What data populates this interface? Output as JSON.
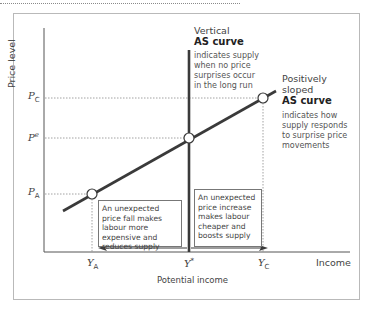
{
  "diagram": {
    "axes": {
      "y_label": "Price level",
      "x_label": "Income",
      "x_sub_label": "Potential income"
    },
    "y_ticks": [
      {
        "id": "pc",
        "base": "P",
        "sub": "C",
        "sup": ""
      },
      {
        "id": "pe",
        "base": "P",
        "sub": "",
        "sup": "e"
      },
      {
        "id": "pa",
        "base": "P",
        "sub": "A",
        "sup": ""
      }
    ],
    "x_ticks": [
      {
        "id": "ya",
        "base": "Y",
        "sub": "A",
        "sup": ""
      },
      {
        "id": "ystar",
        "base": "Y",
        "sub": "",
        "sup": "*"
      },
      {
        "id": "yc",
        "base": "Y",
        "sub": "C",
        "sup": ""
      }
    ],
    "vertical_as": {
      "title_line1": "Vertical",
      "title_line2": "AS curve",
      "description": "indicates supply when no price surprises occur in the long run"
    },
    "sloped_as": {
      "title_line1": "Positively",
      "title_line2": "sloped",
      "title_line3": "AS curve",
      "description": "indicates how supply responds to surprise price movements"
    },
    "box_fall": "An unexpected price fall makes labour more expensive and reduces supply",
    "box_increase": "An unexpected price increase makes labour cheaper and boosts supply",
    "colors": {
      "curve": "#3a3a3a",
      "axis": "#555555",
      "frame": "#b9b9b9",
      "dotted": "#8a8a8a"
    }
  }
}
